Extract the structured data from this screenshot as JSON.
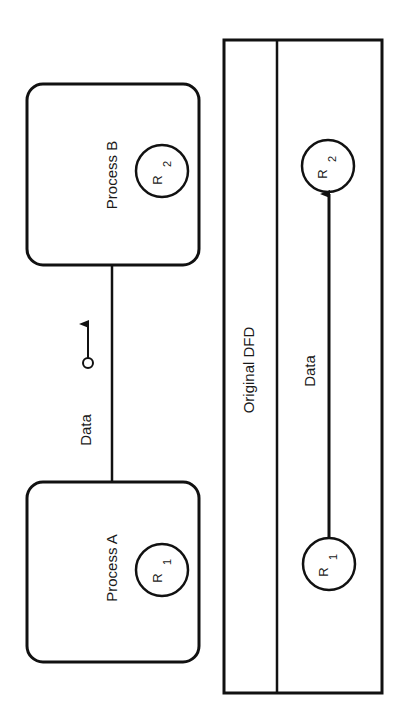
{
  "diagram": {
    "processes": [
      {
        "id": "process-b",
        "label": "Process B",
        "resource": {
          "letter": "R",
          "index": "2"
        }
      },
      {
        "id": "process-a",
        "label": "Process A",
        "resource": {
          "letter": "R",
          "index": "1"
        }
      }
    ],
    "flow": {
      "label": "Data",
      "couple_symbol": "data-couple-arrow"
    },
    "panel": {
      "title": "Original DFD",
      "flow_label": "Data",
      "nodes": [
        {
          "letter": "R",
          "index": "2"
        },
        {
          "letter": "R",
          "index": "1"
        }
      ]
    }
  },
  "colors": {
    "line": "#111111",
    "background": "#ffffff"
  }
}
